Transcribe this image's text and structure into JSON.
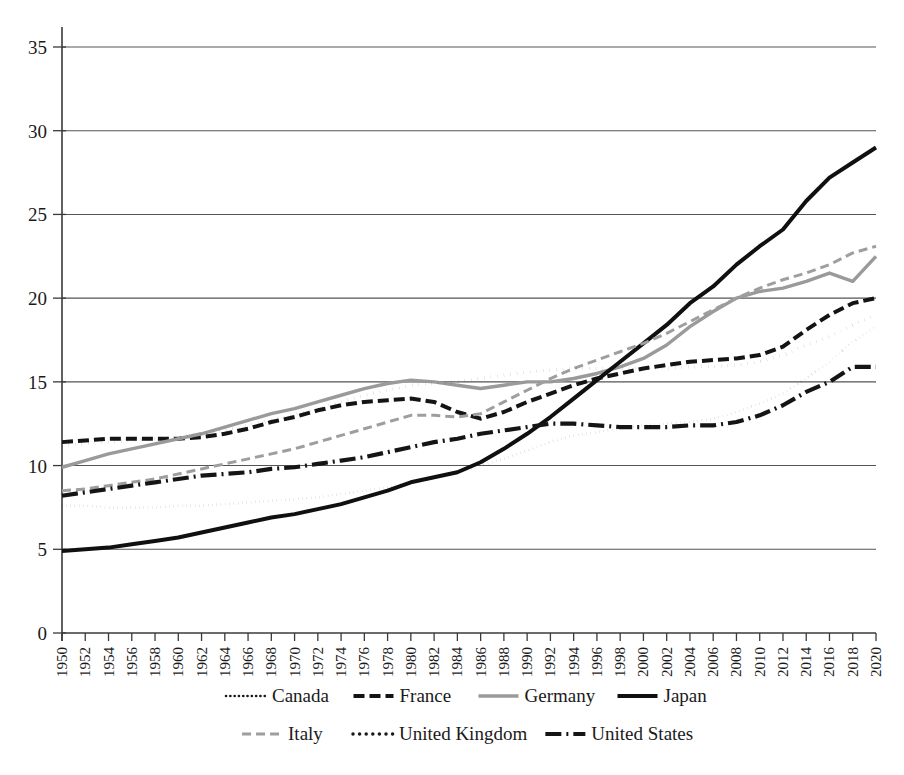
{
  "chart_data": {
    "type": "line",
    "title": "",
    "subtitle": "",
    "xlabel": "",
    "ylabel": "",
    "xlim": [
      1950,
      2020
    ],
    "ylim": [
      0,
      35
    ],
    "yticks": [
      0,
      5,
      10,
      15,
      20,
      25,
      30,
      35
    ],
    "grid": true,
    "legend_position": "bottom",
    "x": [
      1950,
      1952,
      1954,
      1956,
      1958,
      1960,
      1962,
      1964,
      1966,
      1968,
      1970,
      1972,
      1974,
      1976,
      1978,
      1980,
      1982,
      1984,
      1986,
      1988,
      1990,
      1992,
      1994,
      1996,
      1998,
      2000,
      2002,
      2004,
      2006,
      2008,
      2010,
      2012,
      2014,
      2016,
      2018,
      2020
    ],
    "xtick_labels": [
      "1950",
      "1952",
      "1954",
      "1956",
      "1958",
      "1960",
      "1962",
      "1964",
      "1966",
      "1968",
      "1970",
      "1972",
      "1974",
      "1976",
      "1978",
      "1980",
      "1982",
      "1984",
      "1986",
      "1988",
      "1990",
      "1992",
      "1994",
      "1996",
      "1998",
      "2000",
      "2002",
      "2004",
      "2006",
      "2008",
      "2010",
      "2012",
      "2014",
      "2016",
      "2018",
      "2020"
    ],
    "series": [
      {
        "name": "Canada",
        "style": "dotted",
        "color": "#1a1a1a",
        "width": 2.6,
        "dash": "0.1,4.2",
        "values": [
          7.6,
          7.6,
          7.5,
          7.5,
          7.5,
          7.6,
          7.6,
          7.7,
          7.8,
          7.9,
          8.0,
          8.1,
          8.3,
          8.5,
          8.7,
          9.0,
          9.3,
          9.6,
          10.0,
          10.4,
          10.9,
          11.4,
          11.8,
          12.0,
          12.2,
          12.4,
          12.5,
          12.6,
          12.8,
          13.2,
          13.7,
          14.3,
          15.2,
          16.2,
          17.4,
          18.3
        ]
      },
      {
        "name": "France",
        "style": "dashed",
        "color": "#141414",
        "width": 4.0,
        "dash": "11,5",
        "values": [
          11.4,
          11.5,
          11.6,
          11.6,
          11.6,
          11.6,
          11.7,
          11.9,
          12.2,
          12.6,
          12.9,
          13.3,
          13.6,
          13.8,
          13.9,
          14.0,
          13.8,
          13.2,
          12.8,
          13.2,
          13.8,
          14.3,
          14.8,
          15.2,
          15.5,
          15.8,
          16.0,
          16.2,
          16.3,
          16.4,
          16.6,
          17.1,
          18.1,
          19.0,
          19.7,
          20.0
        ]
      },
      {
        "name": "Germany",
        "style": "solid",
        "color": "#9a9a9a",
        "width": 3.4,
        "dash": "none",
        "values": [
          9.9,
          10.3,
          10.7,
          11.0,
          11.3,
          11.6,
          11.9,
          12.3,
          12.7,
          13.1,
          13.4,
          13.8,
          14.2,
          14.6,
          14.9,
          15.1,
          15.0,
          14.8,
          14.6,
          14.8,
          15.0,
          15.0,
          15.2,
          15.5,
          15.9,
          16.4,
          17.2,
          18.3,
          19.2,
          20.0,
          20.4,
          20.6,
          21.0,
          21.5,
          21.0,
          22.5
        ]
      },
      {
        "name": "Japan",
        "style": "solid",
        "color": "#101010",
        "width": 4.0,
        "dash": "none",
        "values": [
          4.9,
          5.0,
          5.1,
          5.3,
          5.5,
          5.7,
          6.0,
          6.3,
          6.6,
          6.9,
          7.1,
          7.4,
          7.7,
          8.1,
          8.5,
          9.0,
          9.3,
          9.6,
          10.2,
          11.0,
          11.9,
          12.9,
          14.0,
          15.1,
          16.2,
          17.3,
          18.4,
          19.7,
          20.7,
          22.0,
          23.1,
          24.1,
          25.8,
          27.2,
          28.1,
          29.0
        ]
      },
      {
        "name": "Italy",
        "style": "dashed",
        "color": "#9e9e9e",
        "width": 3.0,
        "dash": "9,5",
        "values": [
          8.5,
          8.6,
          8.8,
          9.0,
          9.2,
          9.5,
          9.8,
          10.1,
          10.4,
          10.7,
          11.0,
          11.4,
          11.8,
          12.2,
          12.6,
          13.0,
          13.0,
          12.9,
          13.1,
          13.8,
          14.5,
          15.2,
          15.8,
          16.3,
          16.8,
          17.3,
          17.9,
          18.6,
          19.3,
          20.0,
          20.6,
          21.1,
          21.5,
          22.0,
          22.7,
          23.1
        ]
      },
      {
        "name": "United Kingdom",
        "style": "dotted",
        "color": "#1a1a1a",
        "width": 3.4,
        "dash": "0.1,6.5",
        "values": [
          11.2,
          11.3,
          11.4,
          11.5,
          11.6,
          11.7,
          11.9,
          12.1,
          12.4,
          12.7,
          13.0,
          13.4,
          13.8,
          14.2,
          14.5,
          14.8,
          14.9,
          15.0,
          15.2,
          15.4,
          15.6,
          15.7,
          15.8,
          15.8,
          15.8,
          15.8,
          15.8,
          15.9,
          15.9,
          16.0,
          16.2,
          16.6,
          17.2,
          17.7,
          18.4,
          19.0
        ]
      },
      {
        "name": "United States",
        "style": "dash-dot",
        "color": "#151515",
        "width": 4.2,
        "dash": "16,5,2,5",
        "values": [
          8.2,
          8.4,
          8.6,
          8.8,
          9.0,
          9.2,
          9.4,
          9.5,
          9.6,
          9.8,
          9.9,
          10.1,
          10.3,
          10.5,
          10.8,
          11.1,
          11.4,
          11.6,
          11.9,
          12.1,
          12.3,
          12.5,
          12.5,
          12.4,
          12.3,
          12.3,
          12.3,
          12.4,
          12.4,
          12.6,
          13.0,
          13.6,
          14.4,
          15.0,
          15.9,
          15.9
        ]
      }
    ],
    "legend_rows": [
      [
        "Canada",
        "France",
        "Germany",
        "Japan"
      ],
      [
        "Italy",
        "United Kingdom",
        "United States"
      ]
    ]
  }
}
